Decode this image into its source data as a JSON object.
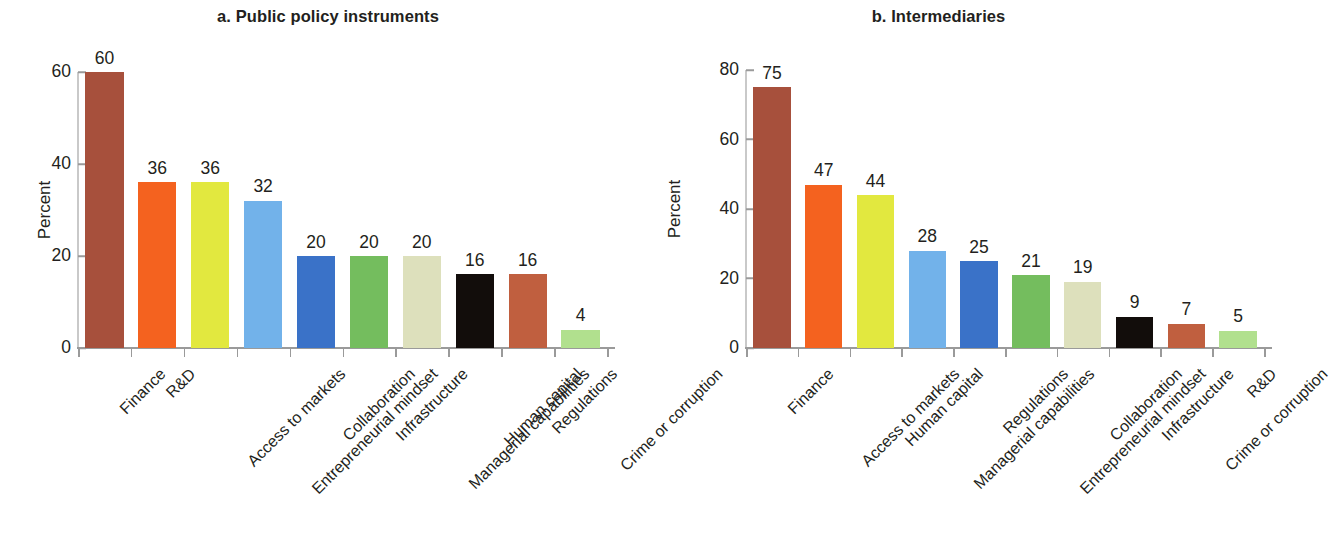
{
  "figure": {
    "panels": [
      {
        "id": "a",
        "title": "a. Public policy instruments",
        "ylabel": "Percent",
        "yticks": [
          "0",
          "20",
          "40",
          "60"
        ]
      },
      {
        "id": "b",
        "title": "b. Intermediaries",
        "ylabel": "Percent",
        "yticks": [
          "0",
          "20",
          "40",
          "60",
          "80"
        ]
      }
    ]
  },
  "chart_data": [
    {
      "type": "bar",
      "title": "a. Public policy instruments",
      "xlabel": "",
      "ylabel": "Percent",
      "ylim": [
        0,
        60
      ],
      "yticks": [
        0,
        20,
        40,
        60
      ],
      "grid": false,
      "legend": "none",
      "categories": [
        "Finance",
        "R&D",
        "Access to markets",
        "Entrepreneurial mindset",
        "Collaboration",
        "Infrastructure",
        "Managerial capabilities",
        "Human capital",
        "Regulations",
        "Crime or corruption"
      ],
      "values": [
        60,
        36,
        36,
        32,
        20,
        20,
        20,
        16,
        16,
        4
      ],
      "value_labels": [
        "60",
        "36",
        "36",
        "32",
        "20",
        "20",
        "20",
        "16",
        "16",
        "4"
      ],
      "colors": [
        "#a7503c",
        "#f4621f",
        "#e2e83f",
        "#72b2ea",
        "#3a72c8",
        "#74bd5e",
        "#dde0bc",
        "#120d0b",
        "#c05f3f",
        "#b1e08e"
      ]
    },
    {
      "type": "bar",
      "title": "b. Intermediaries",
      "xlabel": "",
      "ylabel": "Percent",
      "ylim": [
        0,
        80
      ],
      "yticks": [
        0,
        20,
        40,
        60,
        80
      ],
      "grid": false,
      "legend": "none",
      "categories": [
        "Finance",
        "Access to markets",
        "Human capital",
        "Managerial capabilities",
        "Regulations",
        "Entrepreneurial mindset",
        "Collaboration",
        "Infrastructure",
        "Crime or corruption",
        "R&D"
      ],
      "values": [
        75,
        47,
        44,
        28,
        25,
        21,
        19,
        9,
        7,
        5
      ],
      "value_labels": [
        "75",
        "47",
        "44",
        "28",
        "25",
        "21",
        "19",
        "9",
        "7",
        "5"
      ],
      "colors": [
        "#a7503c",
        "#f4621f",
        "#e2e83f",
        "#72b2ea",
        "#3a72c8",
        "#74bd5e",
        "#dde0bc",
        "#120d0b",
        "#c05f3f",
        "#b1e08e"
      ]
    }
  ]
}
